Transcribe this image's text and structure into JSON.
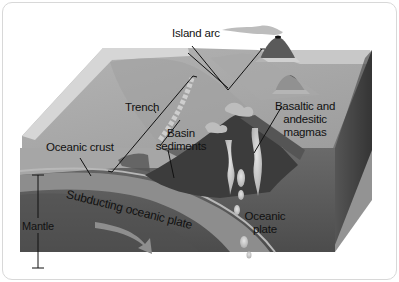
{
  "diagram": {
    "labels": {
      "island_arc": "Island arc",
      "trench": "Trench",
      "basin_sediments_line1": "Basin",
      "basin_sediments_line2": "sediments",
      "basaltic_line1": "Basaltic and",
      "basaltic_line2": "andesitic",
      "basaltic_line3": "magmas",
      "oceanic_crust": "Oceanic crust",
      "subducting_plate": "Subducting oceanic plate",
      "mantle": "Mantle",
      "oceanic_plate_line1": "Oceanic",
      "oceanic_plate_line2": "plate"
    },
    "colors": {
      "sea_surface": "#a9a9a9",
      "sea_side": "#cfcfcf",
      "crust_band": "#8a8a8a",
      "mantle": "#5f5f5f",
      "volcano": "#3e3e3e",
      "magma": "#cfcfcf",
      "smoke": "#bdbdbd",
      "right_face": "#4a4a4a",
      "frame_border": "#d8d8d8"
    }
  }
}
